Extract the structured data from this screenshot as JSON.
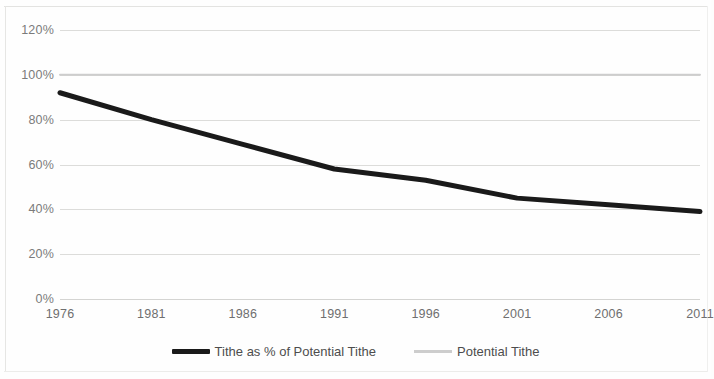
{
  "chart_data": {
    "type": "line",
    "title": "",
    "subtitle": "",
    "xlabel": "",
    "ylabel": "",
    "x": [
      1976,
      1981,
      1986,
      1991,
      1996,
      2001,
      2006,
      2011
    ],
    "xtick_labels": [
      "1976",
      "1981",
      "1986",
      "1991",
      "1996",
      "2001",
      "2006",
      "2011"
    ],
    "xlim": [
      1976,
      2011
    ],
    "ylim": [
      0,
      120
    ],
    "ytick_labels": [
      "0%",
      "20%",
      "40%",
      "60%",
      "80%",
      "100%",
      "120%"
    ],
    "yticks": [
      0,
      20,
      40,
      60,
      80,
      100,
      120
    ],
    "grid": "horizontal",
    "legend_position": "bottom-center",
    "series": [
      {
        "name": "Tithe as % of Potential Tithe",
        "values": [
          92,
          80,
          69,
          58,
          53,
          45,
          42,
          39
        ],
        "color": "#1a1a1a",
        "line_width": 5
      },
      {
        "name": "Potential Tithe",
        "values": [
          100,
          100,
          100,
          100,
          100,
          100,
          100,
          100
        ],
        "color": "#cdcdcd",
        "line_width": 2
      }
    ]
  },
  "legend": {
    "items": [
      {
        "label": "Tithe as % of Potential Tithe"
      },
      {
        "label": "Potential Tithe"
      }
    ]
  },
  "colors": {
    "primary_series": "#1a1a1a",
    "secondary_series": "#cdcdcd",
    "gridline": "#dcdcda",
    "axis_text": "#7b7b7b",
    "background": "#fefefe"
  }
}
